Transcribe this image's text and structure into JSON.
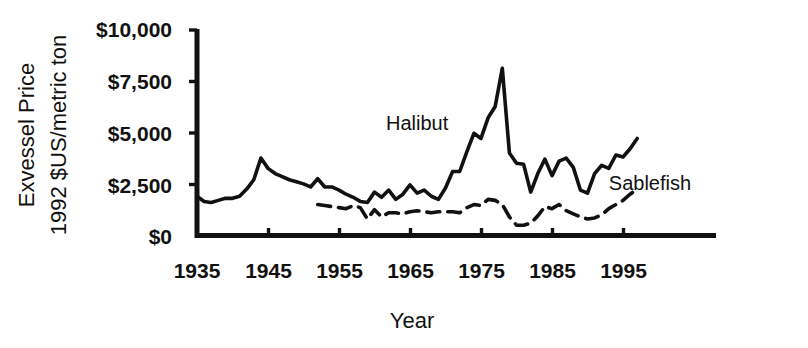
{
  "chart_data": {
    "type": "line",
    "title": "",
    "xlabel": "Year",
    "ylabel": "Exvessel Price\n1992 $US/metric ton",
    "ylabel_line1": "Exvessel Price",
    "ylabel_line2": "1992 $US/metric ton",
    "xlim": [
      1935,
      1998
    ],
    "ylim": [
      0,
      10000
    ],
    "grid": false,
    "legend_position": "inline-annotations",
    "xticks": [
      1935,
      1945,
      1955,
      1965,
      1975,
      1985,
      1995
    ],
    "xtick_labels": [
      "1935",
      "1945",
      "1955",
      "1965",
      "1975",
      "1985",
      "1995"
    ],
    "yticks": [
      0,
      2500,
      5000,
      7500,
      10000
    ],
    "ytick_labels": [
      "$0",
      "$2,500",
      "$5,000",
      "$7,500",
      "$10,000"
    ],
    "annotations": [
      {
        "text": "Halibut",
        "x": 1966,
        "y": 5100
      },
      {
        "text": "Sablefish",
        "x": 1993,
        "y": 2200
      }
    ],
    "series": [
      {
        "name": "Halibut",
        "style": "solid",
        "x": [
          1935,
          1936,
          1937,
          1938,
          1939,
          1940,
          1941,
          1942,
          1943,
          1944,
          1945,
          1946,
          1947,
          1948,
          1949,
          1950,
          1951,
          1952,
          1953,
          1954,
          1955,
          1956,
          1957,
          1958,
          1959,
          1960,
          1961,
          1962,
          1963,
          1964,
          1965,
          1966,
          1967,
          1968,
          1969,
          1970,
          1971,
          1972,
          1973,
          1974,
          1975,
          1976,
          1977,
          1978,
          1979,
          1980,
          1981,
          1982,
          1983,
          1984,
          1985,
          1986,
          1987,
          1988,
          1989,
          1990,
          1991,
          1992,
          1993,
          1994,
          1995,
          1996,
          1997
        ],
        "values": [
          1900,
          1650,
          1600,
          1700,
          1800,
          1800,
          1900,
          2250,
          2700,
          3750,
          3250,
          3000,
          2850,
          2700,
          2600,
          2500,
          2350,
          2750,
          2350,
          2350,
          2200,
          2000,
          1850,
          1650,
          1600,
          2100,
          1850,
          2200,
          1750,
          2000,
          2450,
          2050,
          2200,
          1900,
          1750,
          2300,
          3100,
          3100,
          4050,
          4950,
          4700,
          5700,
          6250,
          8100,
          4000,
          3500,
          3450,
          2100,
          3000,
          3700,
          2900,
          3600,
          3750,
          3300,
          2200,
          2050,
          3000,
          3400,
          3250,
          3900,
          3800,
          4200,
          4700
        ]
      },
      {
        "name": "Sablefish",
        "style": "dashed",
        "x": [
          1952,
          1953,
          1954,
          1955,
          1956,
          1957,
          1958,
          1959,
          1960,
          1961,
          1962,
          1963,
          1964,
          1965,
          1966,
          1967,
          1968,
          1969,
          1970,
          1971,
          1972,
          1973,
          1974,
          1975,
          1976,
          1977,
          1978,
          1979,
          1980,
          1981,
          1982,
          1983,
          1984,
          1985,
          1986,
          1987,
          1988,
          1989,
          1990,
          1991,
          1992,
          1993,
          1994,
          1995,
          1996,
          1997
        ],
        "values": [
          1500,
          1450,
          1400,
          1350,
          1300,
          1450,
          1350,
          800,
          1250,
          900,
          1100,
          1100,
          1050,
          1150,
          1200,
          1150,
          1100,
          1150,
          1150,
          1150,
          1100,
          1350,
          1500,
          1450,
          1750,
          1700,
          1500,
          900,
          500,
          500,
          600,
          950,
          1400,
          1300,
          1500,
          1200,
          1050,
          900,
          800,
          850,
          1000,
          1300,
          1500,
          1700,
          2000,
          2250
        ]
      }
    ]
  }
}
